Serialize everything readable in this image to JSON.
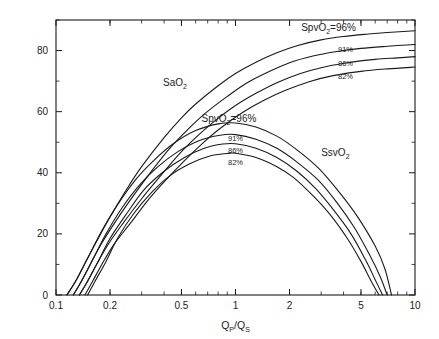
{
  "chart_data": {
    "type": "line",
    "title": "",
    "xlabel": "QP/QS",
    "xlabel_main": "Q",
    "xlabel_sub1": "P",
    "xlabel_slash": "/Q",
    "xlabel_sub2": "S",
    "ylabel": "氧饱和度百分比（%）",
    "xscale": "log",
    "xlim": [
      0.1,
      10
    ],
    "ylim": [
      0,
      90
    ],
    "xticks": [
      0.1,
      0.2,
      0.5,
      1,
      2,
      5,
      10
    ],
    "xticklabels": [
      "0.1",
      "0.2",
      "0.5",
      "1",
      "2",
      "5",
      "10"
    ],
    "yticks": [
      0,
      20,
      40,
      60,
      80
    ],
    "yticklabels": [
      "0",
      "20",
      "40",
      "60",
      "80"
    ],
    "yminorticks": [
      10,
      30,
      50,
      70,
      90
    ],
    "grid": false,
    "legend": "inline-annotations",
    "annotations": [
      {
        "name": "sao2-group-label",
        "text": "SaO2",
        "base": "SaO",
        "sub": "2",
        "x": 0.46,
        "y": 68.5
      },
      {
        "name": "sao2-96-label",
        "text": "SpvO2=96%",
        "base": "SpvO",
        "sub": "2",
        "tail": "=96%",
        "x": 3.3,
        "y": 86.5
      },
      {
        "name": "sao2-91-label",
        "text": "91%",
        "x": 4.1,
        "y": 79.5
      },
      {
        "name": "sao2-86-label",
        "text": "86%",
        "x": 4.1,
        "y": 75.0
      },
      {
        "name": "sao2-82-label",
        "text": "82%",
        "x": 4.1,
        "y": 70.8
      },
      {
        "name": "ssvo2-group-label",
        "text": "SsvO2",
        "base": "SsvO",
        "sub": "2",
        "x": 3.6,
        "y": 45.5
      },
      {
        "name": "ssvo2-96-label",
        "text": "SpvO2=96%",
        "base": "SpvO",
        "sub": "2",
        "tail": "=96%",
        "x": 0.92,
        "y": 56.5
      },
      {
        "name": "ssvo2-91-label",
        "text": "91%",
        "x": 1.0,
        "y": 50.5
      },
      {
        "name": "ssvo2-86-label",
        "text": "86%",
        "x": 1.0,
        "y": 46.5
      },
      {
        "name": "ssvo2-82-label",
        "text": "82%",
        "x": 1.0,
        "y": 42.5
      }
    ],
    "series": [
      {
        "name": "SaO2 SpvO2=96%",
        "group": "SaO2",
        "spvo2": 96,
        "x": [
          0.115,
          0.13,
          0.15,
          0.17,
          0.2,
          0.25,
          0.3,
          0.4,
          0.5,
          0.6,
          0.8,
          1.0,
          1.3,
          1.7,
          2.2,
          3.0,
          4.0,
          5.5,
          7.0,
          10.0
        ],
        "y": [
          0,
          5.0,
          12.0,
          18.0,
          25.5,
          35.0,
          42.0,
          51.5,
          58.0,
          62.5,
          68.5,
          72.5,
          76.2,
          79.3,
          81.6,
          83.5,
          84.6,
          85.4,
          85.9,
          86.5
        ]
      },
      {
        "name": "SaO2 SpvO2=91%",
        "group": "SaO2",
        "spvo2": 91,
        "x": [
          0.125,
          0.14,
          0.16,
          0.18,
          0.22,
          0.27,
          0.33,
          0.43,
          0.55,
          0.68,
          0.9,
          1.15,
          1.5,
          2.0,
          2.7,
          3.6,
          5.0,
          7.0,
          10.0
        ],
        "y": [
          0,
          5.0,
          11.5,
          17.0,
          25.0,
          32.5,
          39.5,
          48.0,
          54.5,
          59.5,
          65.0,
          69.3,
          72.8,
          76.0,
          78.2,
          79.6,
          80.7,
          81.4,
          82.0
        ]
      },
      {
        "name": "SaO2 SpvO2=86%",
        "group": "SaO2",
        "spvo2": 86,
        "x": [
          0.135,
          0.15,
          0.17,
          0.2,
          0.24,
          0.3,
          0.37,
          0.48,
          0.6,
          0.75,
          1.0,
          1.3,
          1.7,
          2.3,
          3.0,
          4.2,
          6.0,
          8.0,
          10.0
        ],
        "y": [
          0,
          4.5,
          10.5,
          17.5,
          24.0,
          31.5,
          38.0,
          45.8,
          51.5,
          56.5,
          62.0,
          66.0,
          69.5,
          72.5,
          74.4,
          76.0,
          77.1,
          77.6,
          78.0
        ]
      },
      {
        "name": "SaO2 SpvO2=82%",
        "group": "SaO2",
        "spvo2": 82,
        "x": [
          0.145,
          0.16,
          0.18,
          0.21,
          0.26,
          0.32,
          0.4,
          0.52,
          0.66,
          0.82,
          1.1,
          1.45,
          1.9,
          2.6,
          3.5,
          5.0,
          7.0,
          10.0
        ],
        "y": [
          0,
          4.5,
          10.0,
          16.5,
          23.5,
          30.5,
          37.0,
          44.0,
          49.8,
          54.5,
          59.8,
          63.8,
          67.0,
          69.9,
          71.8,
          73.2,
          74.0,
          74.6
        ]
      },
      {
        "name": "SsvO2 SpvO2=96%",
        "group": "SsvO2",
        "spvo2": 96,
        "x": [
          0.115,
          0.13,
          0.15,
          0.18,
          0.22,
          0.28,
          0.35,
          0.45,
          0.6,
          0.8,
          1.0,
          1.3,
          1.7,
          2.2,
          2.9,
          3.8,
          4.8,
          6.0,
          6.8,
          7.4
        ],
        "y": [
          0,
          5.0,
          12.0,
          21.0,
          29.5,
          38.0,
          44.0,
          49.5,
          53.8,
          56.0,
          56.3,
          55.0,
          52.0,
          47.5,
          41.5,
          33.5,
          25.5,
          16.0,
          8.5,
          0
        ]
      },
      {
        "name": "SsvO2 SpvO2=91%",
        "group": "SsvO2",
        "spvo2": 91,
        "x": [
          0.125,
          0.14,
          0.16,
          0.19,
          0.23,
          0.29,
          0.37,
          0.48,
          0.63,
          0.82,
          1.0,
          1.3,
          1.7,
          2.2,
          2.9,
          3.7,
          4.6,
          5.6,
          6.4,
          7.0
        ],
        "y": [
          0,
          5.0,
          11.5,
          20.0,
          28.0,
          35.8,
          42.0,
          47.0,
          50.6,
          52.3,
          52.5,
          51.0,
          48.0,
          43.5,
          37.5,
          30.0,
          22.0,
          13.0,
          6.0,
          0
        ]
      },
      {
        "name": "SsvO2 SpvO2=86%",
        "group": "SsvO2",
        "spvo2": 86,
        "x": [
          0.135,
          0.15,
          0.17,
          0.2,
          0.25,
          0.31,
          0.4,
          0.52,
          0.67,
          0.85,
          1.0,
          1.3,
          1.7,
          2.2,
          2.8,
          3.5,
          4.4,
          5.3,
          6.0,
          6.6
        ],
        "y": [
          0,
          4.5,
          10.5,
          18.5,
          27.0,
          34.5,
          40.5,
          45.0,
          48.0,
          49.4,
          49.5,
          48.0,
          45.0,
          40.5,
          34.8,
          28.0,
          20.0,
          11.5,
          5.0,
          0
        ]
      },
      {
        "name": "SsvO2 SpvO2=82%",
        "group": "SsvO2",
        "spvo2": 82,
        "x": [
          0.15,
          0.165,
          0.19,
          0.22,
          0.27,
          0.34,
          0.43,
          0.56,
          0.72,
          0.9,
          1.0,
          1.3,
          1.7,
          2.1,
          2.7,
          3.4,
          4.2,
          5.0,
          5.7,
          6.3
        ],
        "y": [
          0,
          4.5,
          11.0,
          18.5,
          26.5,
          33.5,
          39.0,
          43.0,
          45.5,
          46.3,
          46.4,
          45.0,
          42.0,
          38.5,
          32.5,
          26.0,
          18.5,
          11.0,
          4.5,
          0
        ]
      }
    ]
  },
  "axes": {
    "x_label_parts": {
      "main": "Q",
      "sub1": "P",
      "mid": "/Q",
      "sub2": "S"
    },
    "y_label_text": "氧饱和度百分比（%）"
  }
}
